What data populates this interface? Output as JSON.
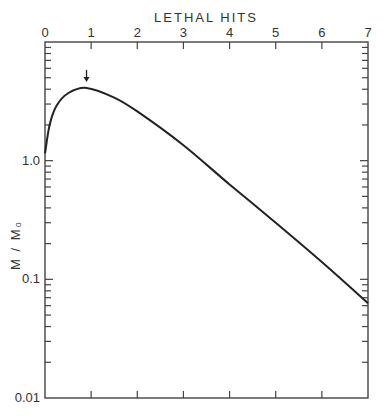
{
  "chart_data": {
    "type": "line",
    "title": "",
    "xlabel": "LETHAL HITS",
    "ylabel": "M / M₀",
    "xlabel_position": "top",
    "xlim": [
      0,
      7
    ],
    "ylim": [
      0.01,
      10
    ],
    "yscale": "log",
    "grid": false,
    "legend": null,
    "x_ticks": [
      0,
      1,
      2,
      3,
      4,
      5,
      6,
      7
    ],
    "x_tick_labels": [
      "0",
      "1",
      "2",
      "3",
      "4",
      "5",
      "6",
      "7"
    ],
    "y_tick_labels": [
      "1.0",
      "0.1",
      "0.01"
    ],
    "y_tick_values": [
      1.0,
      0.1,
      0.01
    ],
    "annotations": [
      {
        "type": "arrow",
        "direction": "down",
        "x": 0.9,
        "y": 4.1,
        "note": "marks curve maximum"
      }
    ],
    "series": [
      {
        "name": "M/Mo",
        "x": [
          0,
          0.1,
          0.25,
          0.5,
          0.9,
          1.5,
          2,
          3,
          4,
          5,
          6,
          7
        ],
        "y": [
          1.15,
          2.0,
          2.9,
          3.7,
          4.1,
          3.4,
          2.6,
          1.35,
          0.63,
          0.3,
          0.14,
          0.063
        ]
      }
    ]
  },
  "labels": {
    "x_axis_title": "LETHAL HITS",
    "y_axis_title": "M / M₀"
  }
}
